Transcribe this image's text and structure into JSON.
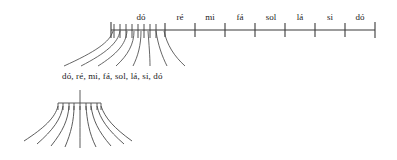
{
  "figure": {
    "type": "diagram",
    "background_color": "#ffffff",
    "ink_color": "#3a3a3a"
  },
  "scale_axis": {
    "name": "note-scale-axis",
    "axis_y": 30,
    "axis_x_start": 111,
    "axis_x_end": 375,
    "labels": [
      {
        "text": "dó",
        "tick_x": 147,
        "label_x": 140,
        "label_y": 19
      },
      {
        "text": "ré",
        "tick_x": 165,
        "label_x": 179,
        "label_y": 19
      },
      {
        "text": "mi",
        "tick_x": 196,
        "label_x": 209,
        "label_y": 19
      },
      {
        "text": "fá",
        "tick_x": 226,
        "label_x": 240,
        "label_y": 19
      },
      {
        "text": "sol",
        "tick_x": 256,
        "label_x": 271,
        "label_y": 19
      },
      {
        "text": "lá",
        "tick_x": 286,
        "label_x": 299,
        "label_y": 19
      },
      {
        "text": "si",
        "tick_x": 315,
        "label_x": 329,
        "label_y": 19
      },
      {
        "text": "dó",
        "tick_x": 345,
        "label_x": 359,
        "label_y": 19
      }
    ],
    "cluster_ticks": [
      111,
      117,
      123,
      129,
      135,
      141,
      147,
      159,
      165
    ],
    "cluster_tick_top": 24,
    "cluster_tick_bottom": 38
  },
  "upper_fan": {
    "name": "compression-fan",
    "line_count": 8,
    "origin_y": 30,
    "target_y": 64,
    "origins": [
      115,
      122,
      129,
      136,
      143,
      150,
      158,
      165
    ],
    "targets": [
      64,
      81,
      98,
      116,
      133,
      150,
      167,
      185
    ]
  },
  "caption": {
    "text": "dó, ré, mi, fá, sol, lá, si, dó",
    "x": 62,
    "y": 78
  },
  "lower_fan": {
    "name": "bell-fan",
    "stem_x": 80,
    "stem_top": 91,
    "bar_y": 103,
    "bar_x_start": 58,
    "bar_x_end": 101,
    "tick_count": 9,
    "spread_bottom_y": 147,
    "origins": [
      58,
      63,
      68,
      74,
      80,
      86,
      92,
      97,
      101
    ],
    "targets": [
      23,
      36,
      50,
      65,
      80,
      96,
      111,
      124,
      131
    ]
  }
}
